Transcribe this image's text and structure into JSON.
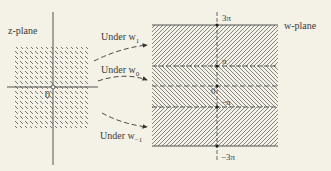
{
  "z_plane": {
    "title": "z-plane",
    "origin_label": "0",
    "region": "square centered at origin, hatched"
  },
  "w_plane": {
    "title": "w-plane",
    "axis_labels": {
      "top": "3π",
      "pi": "π",
      "zero": "0",
      "neg_pi": "−π",
      "bottom": "−3π"
    },
    "strips": [
      {
        "name": "w1-strip",
        "range": "π to 3π",
        "hatch": "forward"
      },
      {
        "name": "w0-strip",
        "range": "−π to π",
        "hatch": "backward"
      },
      {
        "name": "w-1-strip",
        "range": "−3π to −π",
        "hatch": "forward"
      }
    ]
  },
  "mappings": [
    {
      "label": "Under w",
      "sub": "1"
    },
    {
      "label": "Under w",
      "sub": "0"
    },
    {
      "label": "Under w",
      "sub": "−1"
    }
  ],
  "colors": {
    "background": "#f4f1e6",
    "ink": "#3a3a3a"
  }
}
